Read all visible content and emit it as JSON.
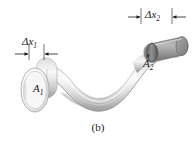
{
  "figure": {
    "caption": "(b)",
    "labels": {
      "dx1_prefix": "Δx",
      "dx1_sub": "1",
      "dx2_prefix": "Δx",
      "dx2_sub": "2",
      "a1_prefix": "A",
      "a1_sub": "1",
      "a2_prefix": "A",
      "a2_sub": "2"
    },
    "colors": {
      "ink": "#1a1a1a",
      "tube_light": "#f2f2f2",
      "tube_mid": "#cfcfcf",
      "tube_shadow": "#9a9a9a",
      "tube_dark_end": "#8c8c8c",
      "band_dark": "#6f6f6f",
      "background": "#ffffff"
    },
    "elements": [
      "left-opening-ellipse",
      "left-collar-band",
      "s-curved-tube-body",
      "right-narrow-tube",
      "right-dark-band",
      "dimension-dx1",
      "dimension-dx2",
      "leader-line-a2"
    ]
  }
}
